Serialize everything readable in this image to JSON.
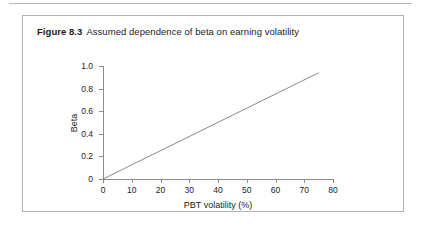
{
  "figure": {
    "number_label": "Figure 8.3",
    "caption": "Assumed dependence of beta on earning volatility"
  },
  "colors": {
    "axis": "#8d8d8d",
    "series_line": "#7c7c7c",
    "border": "#b3b3b3",
    "rule": "#b9b9b9",
    "text": "#1b1b1b"
  },
  "chart_data": {
    "type": "line",
    "title": "Assumed dependence of beta on earning volatility",
    "xlabel": "PBT volatility (%)",
    "ylabel": "Beta",
    "xlim": [
      0,
      80
    ],
    "ylim": [
      0,
      1.0
    ],
    "xticks": [
      0,
      10,
      20,
      30,
      40,
      50,
      60,
      70,
      80
    ],
    "xtick_labels": [
      "0",
      "10",
      "20",
      "30",
      "40",
      "50",
      "60",
      "70",
      "80"
    ],
    "yticks": [
      0,
      0.2,
      0.4,
      0.6,
      0.8,
      1.0
    ],
    "ytick_labels": [
      "0",
      "0.2",
      "0.4",
      "0.6",
      "0.8",
      "1.0"
    ],
    "grid": false,
    "legend": false,
    "series": [
      {
        "name": "Assumed beta",
        "x": [
          0,
          75
        ],
        "y": [
          0,
          0.94
        ]
      }
    ],
    "annotations": []
  }
}
